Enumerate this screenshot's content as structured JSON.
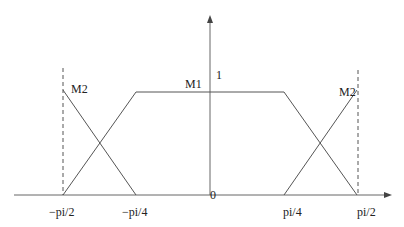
{
  "diagram": {
    "type": "membership-functions",
    "axes": {
      "x_ticks": [
        {
          "label": "−pi/2",
          "value": -1.5708
        },
        {
          "label": "−pi/4",
          "value": -0.7854
        },
        {
          "label": "pi/4",
          "value": 0.7854
        },
        {
          "label": "pi/2",
          "value": 1.5708
        }
      ],
      "y_labels": {
        "one": "1",
        "zero": "0"
      }
    },
    "functions": [
      {
        "name": "M1",
        "label": "M1",
        "shape": "trapezoid",
        "points": [
          [
            -1.5708,
            0
          ],
          [
            -0.7854,
            1
          ],
          [
            0.7854,
            1
          ],
          [
            1.5708,
            0
          ]
        ]
      },
      {
        "name": "M2-left",
        "label": "M2",
        "shape": "descending-ramp",
        "points": [
          [
            -1.5708,
            1
          ],
          [
            -0.7854,
            0
          ]
        ]
      },
      {
        "name": "M2-right",
        "label": "M2",
        "shape": "ascending-ramp",
        "points": [
          [
            0.7854,
            0
          ],
          [
            1.5708,
            1
          ]
        ]
      }
    ],
    "guides": [
      {
        "type": "dashed-vertical",
        "at": "−pi/2"
      },
      {
        "type": "dashed-vertical",
        "at": "pi/2"
      }
    ],
    "colors": {
      "line": "#555555",
      "text": "#222222",
      "background": "#ffffff"
    }
  }
}
